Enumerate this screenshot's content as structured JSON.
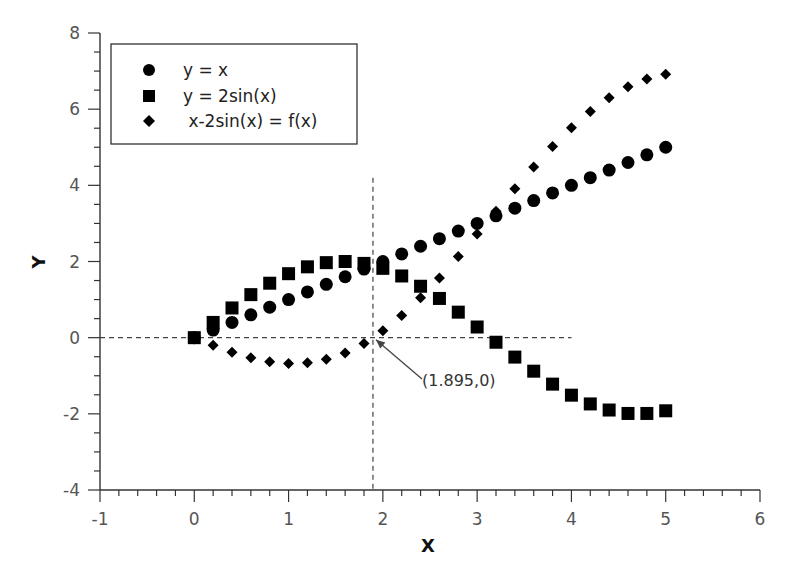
{
  "chart_data": {
    "type": "scatter",
    "title": "",
    "xlabel": "X",
    "ylabel": "Y",
    "xlim": [
      -1,
      6
    ],
    "ylim": [
      -4,
      8
    ],
    "x_ticks": [
      -1,
      0,
      1,
      2,
      3,
      4,
      5,
      6
    ],
    "y_ticks": [
      -4,
      -2,
      0,
      2,
      4,
      6,
      8
    ],
    "x_tick_labels": [
      "-1",
      "0",
      "1",
      "2",
      "3",
      "4",
      "5",
      "6"
    ],
    "y_tick_labels": [
      "-4",
      "-2",
      "0",
      "2",
      "4",
      "6",
      "8"
    ],
    "grid": false,
    "legend_position": "upper left (boxed)",
    "x": [
      0,
      0.2,
      0.4,
      0.6,
      0.8,
      1.0,
      1.2,
      1.4,
      1.6,
      1.8,
      2.0,
      2.2,
      2.4,
      2.6,
      2.8,
      3.0,
      3.2,
      3.4,
      3.6,
      3.8,
      4.0,
      4.2,
      4.4,
      4.6,
      4.8,
      5.0
    ],
    "series": [
      {
        "name": "y = x",
        "marker": "circle",
        "values": [
          0,
          0.2,
          0.4,
          0.6,
          0.8,
          1.0,
          1.2,
          1.4,
          1.6,
          1.8,
          2.0,
          2.2,
          2.4,
          2.6,
          2.8,
          3.0,
          3.2,
          3.4,
          3.6,
          3.8,
          4.0,
          4.2,
          4.4,
          4.6,
          4.8,
          5.0
        ]
      },
      {
        "name": "y = 2sin(x)",
        "marker": "square",
        "values": [
          0,
          0.4,
          0.78,
          1.13,
          1.43,
          1.68,
          1.86,
          1.97,
          2.0,
          1.95,
          1.82,
          1.62,
          1.35,
          1.03,
          0.67,
          0.28,
          -0.12,
          -0.51,
          -0.88,
          -1.22,
          -1.51,
          -1.74,
          -1.9,
          -1.99,
          -1.99,
          -1.92
        ]
      },
      {
        "name": " x-2sin(x) = f(x)",
        "marker": "diamond",
        "values": [
          0,
          -0.2,
          -0.38,
          -0.53,
          -0.63,
          -0.68,
          -0.66,
          -0.57,
          -0.4,
          -0.15,
          0.18,
          0.58,
          1.05,
          1.57,
          2.13,
          2.72,
          3.32,
          3.91,
          4.48,
          5.02,
          5.51,
          5.94,
          6.3,
          6.59,
          6.79,
          6.92
        ]
      }
    ],
    "annotations": [
      {
        "type": "vline",
        "style": "dashed",
        "x": 1.895,
        "y_range": [
          -4,
          4.2
        ]
      },
      {
        "type": "hline",
        "style": "dashed",
        "y": 0,
        "x_range": [
          -1,
          4
        ]
      },
      {
        "type": "arrow-label",
        "text": "(1.895,0)",
        "points_to": [
          1.895,
          0
        ],
        "text_at": [
          2.5,
          -1.1
        ]
      }
    ]
  },
  "legend": {
    "items": [
      {
        "label": "y = x",
        "marker": "circle"
      },
      {
        "label": "y = 2sin(x)",
        "marker": "square"
      },
      {
        "label": " x-2sin(x) = f(x)",
        "marker": "diamond"
      }
    ]
  },
  "axes": {
    "x_title": "X",
    "y_title": "Y"
  },
  "annotation": {
    "label": "(1.895,0)"
  },
  "colors": {
    "markers": "#000000",
    "axes": "#333333",
    "tick_text": "#555555",
    "dashed_lines": "#444444",
    "background": "#ffffff"
  }
}
